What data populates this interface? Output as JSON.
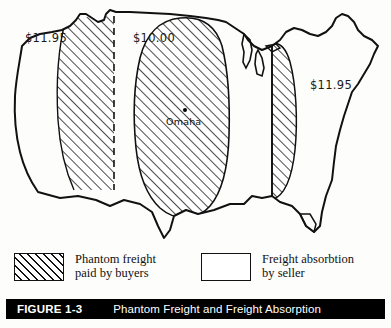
{
  "figure": {
    "number": "FIGURE 1-3",
    "title": "Phantom Freight and Freight Absorption"
  },
  "map": {
    "region": "United States",
    "city": {
      "name": "Omaha",
      "marker": "city-dot"
    },
    "price_labels": [
      {
        "id": "west",
        "value": "$11.95",
        "zone": "phantom-freight-west"
      },
      {
        "id": "central",
        "value": "$10.00",
        "zone": "base-price-central"
      },
      {
        "id": "east",
        "value": "$11.95",
        "zone": "phantom-freight-east"
      }
    ],
    "colors": {
      "outline": "#111111",
      "hatch": "#111111",
      "background": "#ffffff"
    }
  },
  "legend": {
    "items": [
      {
        "id": "phantom-freight",
        "swatch": "hatched",
        "line1": "Phantom freight",
        "line2": "paid by buyers"
      },
      {
        "id": "freight-absorption",
        "swatch": "empty",
        "line1": "Freight absorbtion",
        "line2": "by seller"
      }
    ]
  }
}
